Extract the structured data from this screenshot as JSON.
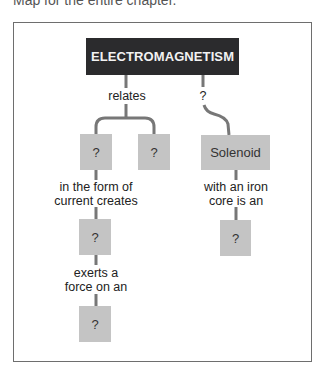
{
  "caption": "Map for the entire chapter.",
  "concept_map": {
    "root": "ELECTROMAGNETISM",
    "links": {
      "relates": "relates",
      "right_unknown": "?",
      "in_form_of_current": [
        "in the form of",
        "current creates"
      ],
      "exerts_force": [
        "exerts a",
        "force on an"
      ],
      "iron_core": [
        "with an iron",
        "core is an"
      ]
    },
    "nodes": {
      "left_a": "?",
      "left_b": "?",
      "left_c": "?",
      "left_d": "?",
      "solenoid": "Solenoid",
      "right_d": "?"
    }
  },
  "colors": {
    "root_fill": "#2b2b2d",
    "node_fill": "#c4c4c4",
    "line": "#777777",
    "frame": "#6e6e6e"
  }
}
